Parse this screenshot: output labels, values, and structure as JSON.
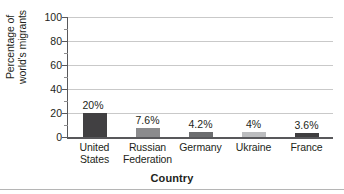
{
  "chart_data": {
    "type": "bar",
    "title": "",
    "xlabel": "Country",
    "ylabel": "Percentage of world's migrants",
    "ylabel_lines": [
      "Percentage of",
      "world's migrants"
    ],
    "categories": [
      "United States",
      "Russian Federation",
      "Germany",
      "Ukraine",
      "France"
    ],
    "category_lines": [
      [
        "United",
        "States"
      ],
      [
        "Russian",
        "Federation"
      ],
      [
        "Germany"
      ],
      [
        "Ukraine"
      ],
      [
        "France"
      ]
    ],
    "values": [
      20,
      7.6,
      4.2,
      4,
      3.6
    ],
    "value_labels": [
      "20%",
      "7.6%",
      "4.2%",
      "4%",
      "3.6%"
    ],
    "bar_colors": [
      "#414042",
      "#8b8b8d",
      "#6d6e70",
      "#bcbdbf",
      "#3f3e40"
    ],
    "ylim": [
      0,
      100
    ],
    "ytick_labels": [
      "0",
      "20",
      "40",
      "60",
      "80",
      "100"
    ],
    "ytick_values": [
      0,
      20,
      40,
      60,
      80,
      100
    ],
    "yminor_values": [
      10,
      30,
      50,
      70,
      90
    ],
    "grid": "horizontal",
    "legend": "none",
    "gridline_color": "#c9c9c9",
    "axis_color": "#58585b"
  }
}
